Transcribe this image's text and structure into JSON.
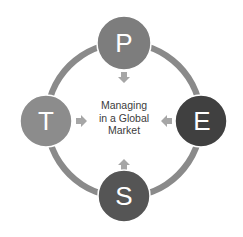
{
  "diagram": {
    "type": "cycle",
    "center": {
      "lines": [
        "Managing",
        "in a Global",
        "Market"
      ]
    },
    "ring_color": "#8a8a8a",
    "arrow_color": "#a6a6a6",
    "nodes": [
      {
        "id": "p",
        "label": "P",
        "position": "top",
        "color": "#7d7d7d"
      },
      {
        "id": "e",
        "label": "E",
        "position": "right",
        "color": "#404040"
      },
      {
        "id": "s",
        "label": "S",
        "position": "bottom",
        "color": "#555555"
      },
      {
        "id": "t",
        "label": "T",
        "position": "left",
        "color": "#8c8c8c"
      }
    ],
    "arrows": [
      {
        "from": "p",
        "direction": "down"
      },
      {
        "from": "e",
        "direction": "left"
      },
      {
        "from": "s",
        "direction": "up"
      },
      {
        "from": "t",
        "direction": "right"
      }
    ]
  }
}
